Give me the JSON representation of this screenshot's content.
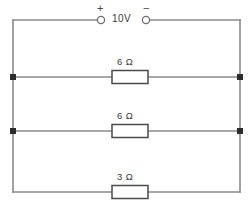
{
  "diagram": {
    "type": "electrical-schematic",
    "colors": {
      "wire": "#8a8a8a",
      "node": "#2b2b2b",
      "component_outline": "#4a4a4a",
      "text": "#3a3a3a",
      "background": "#ffffff"
    },
    "source": {
      "name": "voltage-source",
      "label": "10V",
      "plus_sign": "+",
      "minus_sign": "−",
      "plus_terminal_name": "positive-terminal",
      "minus_terminal_name": "negative-terminal"
    },
    "branches": [
      {
        "id": "branch-1",
        "resistor_label": "6 Ω",
        "resistance": 6,
        "unit": "Ω"
      },
      {
        "id": "branch-2",
        "resistor_label": "6 Ω",
        "resistance": 6,
        "unit": "Ω"
      },
      {
        "id": "branch-3",
        "resistor_label": "3 Ω",
        "resistance": 3,
        "unit": "Ω"
      }
    ]
  }
}
